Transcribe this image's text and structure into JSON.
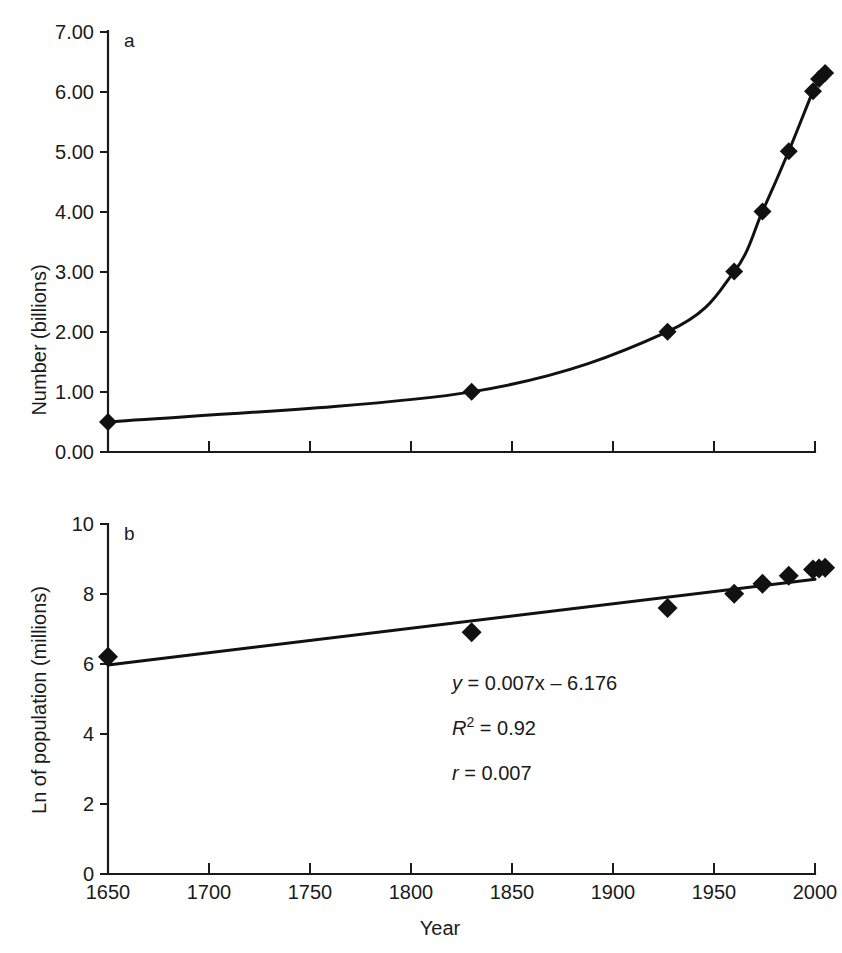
{
  "figure": {
    "background": "#ffffff",
    "ink_color": "#111111"
  },
  "panel_a": {
    "label": "a",
    "ylabel": "Number (billions)",
    "ytick_labels": [
      "0.00",
      "1.00",
      "2.00",
      "3.00",
      "4.00",
      "5.00",
      "6.00",
      "7.00"
    ],
    "xtick_labels": [
      "",
      "",
      "",
      "",
      "",
      "",
      "",
      ""
    ]
  },
  "panel_b": {
    "label": "b",
    "ylabel": "Ln of population (millions)",
    "xlabel": "Year",
    "ytick_labels": [
      "0",
      "2",
      "4",
      "6",
      "8",
      "10"
    ],
    "xtick_labels": [
      "1650",
      "1700",
      "1750",
      "1800",
      "1850",
      "1900",
      "1950",
      "2000"
    ],
    "annotations": {
      "equation_y": "y",
      "equation_rest": " = 0.007x – 6.176",
      "equation_full": "y = 0.007x – 6.176",
      "r_squared_symbol": "R",
      "r_squared_exponent": "2",
      "r_squared_rest": " = 0.92",
      "r_squared_full": "R2 = 0.92",
      "r_symbol": "r",
      "r_rest": " = 0.007",
      "r_full": "r = 0.007"
    }
  },
  "chart_data": [
    {
      "type": "line",
      "panel": "a",
      "title": "",
      "xlabel": "",
      "ylabel": "Number (billions)",
      "xlim": [
        1650,
        2000
      ],
      "ylim": [
        0.0,
        7.0
      ],
      "xticks": [
        1650,
        1700,
        1750,
        1800,
        1850,
        1900,
        1950,
        2000
      ],
      "yticks": [
        0.0,
        1.0,
        2.0,
        3.0,
        4.0,
        5.0,
        6.0,
        7.0
      ],
      "ytick_labels": [
        "0.00",
        "1.00",
        "2.00",
        "3.00",
        "4.00",
        "5.00",
        "6.00",
        "7.00"
      ],
      "grid": false,
      "legend": "none",
      "marker": "diamond",
      "series": [
        {
          "name": "World population",
          "x": [
            1650,
            1830,
            1927,
            1960,
            1974,
            1987,
            1999,
            2002,
            2005
          ],
          "values": [
            0.5,
            1.0,
            2.0,
            3.0,
            4.0,
            5.0,
            6.0,
            6.2,
            6.3
          ]
        }
      ]
    },
    {
      "type": "scatter",
      "panel": "b",
      "title": "",
      "xlabel": "Year",
      "ylabel": "Ln of population (millions)",
      "xlim": [
        1650,
        2000
      ],
      "ylim": [
        0,
        10
      ],
      "xticks": [
        1650,
        1700,
        1750,
        1800,
        1850,
        1900,
        1950,
        2000
      ],
      "yticks": [
        0,
        2,
        4,
        6,
        8,
        10
      ],
      "grid": false,
      "legend": "none",
      "marker": "diamond",
      "series": [
        {
          "name": "Ln(population)",
          "x": [
            1650,
            1830,
            1927,
            1960,
            1974,
            1987,
            1999,
            2002,
            2005
          ],
          "values": [
            6.21,
            6.91,
            7.6,
            8.01,
            8.29,
            8.52,
            8.7,
            8.73,
            8.75
          ]
        }
      ],
      "fit": {
        "type": "linear",
        "slope": 0.007,
        "intercept": -6.176,
        "r_squared": 0.92,
        "r": 0.007,
        "equation": "y = 0.007x – 6.176",
        "x_endpoints": [
          1650,
          2000
        ],
        "y_endpoints": [
          5.97,
          8.42
        ]
      }
    }
  ]
}
